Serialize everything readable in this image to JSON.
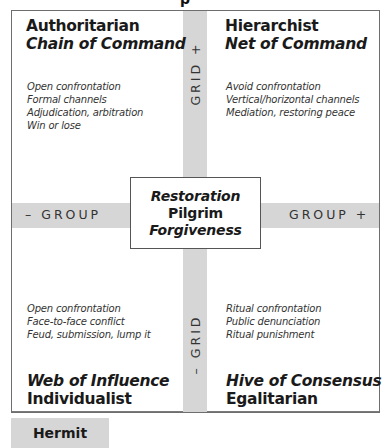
{
  "diagram": {
    "top_fragment": "p",
    "quadrants": {
      "top_left": {
        "title": "Authoritarian",
        "subtitle": "Chain of Command",
        "items": [
          "Open confrontation",
          "Formal channels",
          "Adjudication, arbitration",
          "Win or lose"
        ]
      },
      "top_right": {
        "title": "Hierarchist",
        "subtitle": "Net of Command",
        "items": [
          "Avoid confrontation",
          "Vertical/horizontal channels",
          "Mediation, restoring peace"
        ]
      },
      "bottom_left": {
        "subtitle": "Web of Influence",
        "title": "Individualist",
        "items": [
          "Open confrontation",
          "Face-to-face conflict",
          "Feud, submission, lump it"
        ]
      },
      "bottom_right": {
        "subtitle": "Hive of Consensus",
        "title": "Egalitarian",
        "items": [
          "Ritual confrontation",
          "Public denunciation",
          "Ritual punishment"
        ]
      }
    },
    "axes": {
      "grid_plus": "GRID +",
      "grid_minus": "– GRID",
      "group_minus": "– GROUP",
      "group_plus": "GROUP +"
    },
    "center": {
      "line1": "Restoration",
      "line2": "Pilgrim",
      "line3": "Forgiveness"
    },
    "outside": {
      "hermit": "Hermit"
    },
    "colors": {
      "band": "#d6d6d6",
      "border": "#6e6e6e",
      "text": "#1a1a1a"
    }
  }
}
